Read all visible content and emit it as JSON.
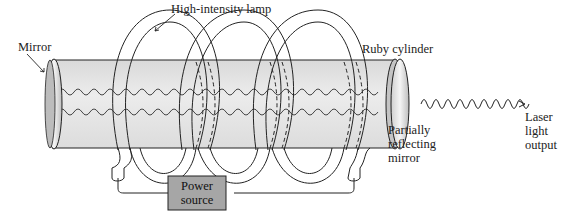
{
  "figure": {
    "labels": {
      "lamp": "High-intensity lamp",
      "mirror": "Mirror",
      "ruby": "Ruby cylinder",
      "partial_line1": "Partially",
      "partial_line2": "reflecting",
      "partial_line3": "mirror",
      "laser_line1": "Laser",
      "laser_line2": "light",
      "laser_line3": "output",
      "power_line1": "Power",
      "power_line2": "source"
    },
    "colors": {
      "cylinder_fill": "#e4e4e4",
      "power_box": "#a6a6a6",
      "stroke": "#222222"
    }
  }
}
